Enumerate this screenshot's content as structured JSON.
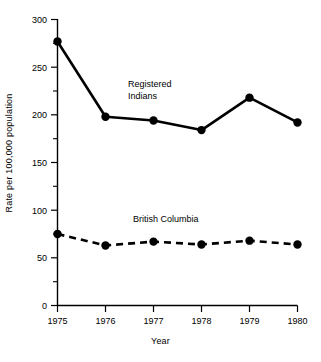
{
  "chart_data": {
    "type": "line",
    "title": "",
    "xlabel": "Year",
    "ylabel": "Rate per 100,000 population",
    "categories": [
      "1975",
      "1976",
      "1977",
      "1978",
      "1979",
      "1980"
    ],
    "x": [
      1975,
      1976,
      1977,
      1978,
      1979,
      1980
    ],
    "xlim": [
      1975,
      1980
    ],
    "ylim": [
      0,
      300
    ],
    "y_major_ticks": [
      0,
      50,
      100,
      150,
      200,
      250,
      300
    ],
    "y_minor_ticks": [
      25,
      75,
      125,
      175,
      225,
      275
    ],
    "grid": false,
    "legend_position": "inline-annotations",
    "series": [
      {
        "name": "Registered Indians",
        "values": [
          277,
          198,
          194,
          184,
          218,
          192
        ],
        "line_style": "solid",
        "marker": "filled-circle",
        "color": "#000000",
        "annotation": "Registered Indians",
        "annotation_lines": [
          "Registered",
          "Indians"
        ]
      },
      {
        "name": "British Columbia",
        "values": [
          75,
          63,
          67,
          64,
          68,
          64
        ],
        "line_style": "dashed",
        "marker": "filled-circle",
        "color": "#000000",
        "annotation": "British Columbia",
        "annotation_lines": [
          "British Columbia"
        ]
      }
    ]
  },
  "axes": {
    "y_tick_labels": [
      "300",
      "250",
      "200",
      "150",
      "100",
      "50",
      "0"
    ],
    "x_tick_labels": [
      "1975",
      "1976",
      "1977",
      "1978",
      "1979",
      "1980"
    ],
    "y_axis_title": "Rate per 100,000 population",
    "x_axis_title": "Year"
  },
  "annotations": {
    "registered_indians_line1": "Registered",
    "registered_indians_line2": "Indians",
    "british_columbia": "British Columbia"
  },
  "colors": {
    "ink": "#000000",
    "background": "#ffffff"
  }
}
